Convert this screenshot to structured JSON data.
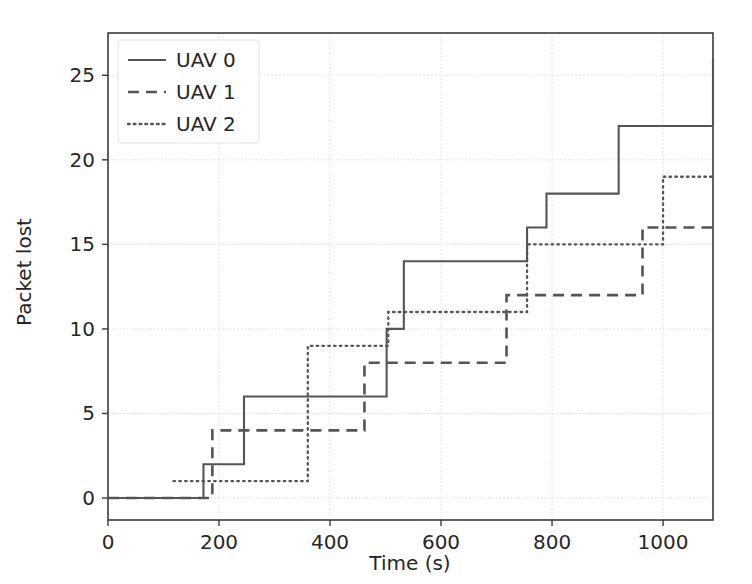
{
  "chart_data": {
    "type": "line",
    "title": "",
    "xlabel": "Time (s)",
    "ylabel": "Packet lost",
    "xlim": [
      0,
      1090
    ],
    "ylim": [
      -1.3,
      27.5
    ],
    "xticks": [
      0,
      200,
      400,
      600,
      800,
      1000
    ],
    "yticks": [
      0,
      5,
      10,
      15,
      20,
      25
    ],
    "xtick_labels": [
      "0",
      "200",
      "400",
      "600",
      "800",
      "1000"
    ],
    "ytick_labels": [
      "0",
      "5",
      "10",
      "15",
      "20",
      "25"
    ],
    "grid": true,
    "legend_position": "upper left",
    "drawstyle": "steps-post",
    "series": [
      {
        "name": "UAV 0",
        "linestyle": "solid",
        "color": "#555555",
        "x": [
          0,
          172,
          245,
          502,
          533,
          755,
          790,
          920,
          1090
        ],
        "y": [
          0,
          2,
          6,
          10,
          14,
          16,
          18,
          22,
          26
        ]
      },
      {
        "name": "UAV 1",
        "linestyle": "dashed",
        "color": "#555555",
        "x": [
          0,
          188,
          462,
          718,
          963,
          1090
        ],
        "y": [
          0,
          4,
          8,
          12,
          16,
          16
        ]
      },
      {
        "name": "UAV 2",
        "linestyle": "dotted",
        "color": "#555555",
        "x": [
          118,
          360,
          505,
          755,
          1000,
          1090
        ],
        "y": [
          1,
          9,
          11,
          15,
          19,
          19
        ]
      }
    ]
  },
  "legend": {
    "entries": [
      {
        "label": "UAV 0",
        "style": "solid"
      },
      {
        "label": "UAV 1",
        "style": "dashed"
      },
      {
        "label": "UAV 2",
        "style": "dotted"
      }
    ]
  }
}
